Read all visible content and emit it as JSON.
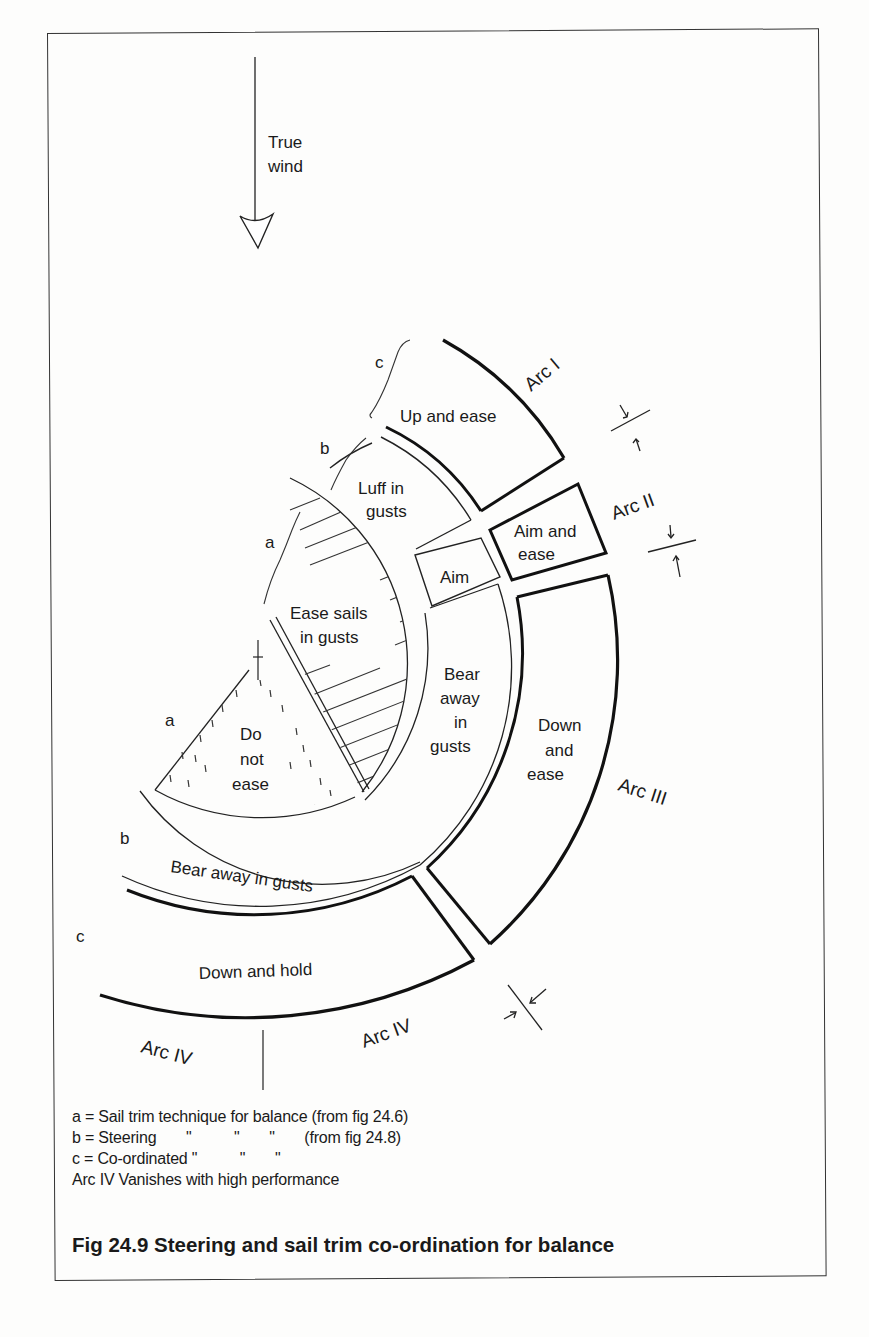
{
  "figure": {
    "caption": "Fig 24.9 Steering and sail trim co-ordination for balance",
    "wind_label_line1": "True",
    "wind_label_line2": "wind"
  },
  "regions": {
    "up_and_ease": "Up and ease",
    "luff_line1": "Luff in",
    "luff_line2": "gusts",
    "aim_and_ease_line1": "Aim and",
    "aim_and_ease_line2": "ease",
    "aim": "Aim",
    "ease_sails_line1": "Ease sails",
    "ease_sails_line2": "in gusts",
    "do_not_ease_line1": "Do",
    "do_not_ease_line2": "not",
    "do_not_ease_line3": "ease",
    "bear_away_line1": "Bear",
    "bear_away_line2": "away",
    "bear_away_line3": "in",
    "bear_away_line4": "gusts",
    "down_and_ease_line1": "Down",
    "down_and_ease_line2": "and",
    "down_and_ease_line3": "ease",
    "bear_away_in_gusts": "Bear away in gusts",
    "down_and_hold": "Down and hold"
  },
  "arcs": {
    "arc1": "Arc I",
    "arc2": "Arc II",
    "arc3": "Arc III",
    "arc4_left": "Arc IV",
    "arc4_right": "Arc IV"
  },
  "markers": {
    "a_upper": "a",
    "a_lower": "a",
    "b_upper": "b",
    "b_lower": "b",
    "c_upper": "c",
    "c_lower": "c"
  },
  "legend": [
    "a = Sail trim technique for balance (from fig 24.6)",
    "b = Steering       \"          \"       \"       (from fig 24.8)",
    "c = Co-ordinated \"          \"       \"",
    "Arc IV Vanishes with high performance"
  ]
}
